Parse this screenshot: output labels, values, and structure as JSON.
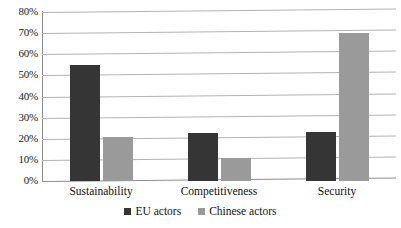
{
  "chart_data": {
    "type": "bar",
    "title": "",
    "subtitle": "",
    "xlabel": "",
    "ylabel": "",
    "categories": [
      "Sustainability",
      "Competitiveness",
      "Security"
    ],
    "series": [
      {
        "name": "EU actors",
        "color": "#353535",
        "values": [
          55,
          22.5,
          23
        ]
      },
      {
        "name": "Chinese actors",
        "color": "#9a9a9a",
        "values": [
          21,
          11,
          70
        ]
      }
    ],
    "ylim": [
      0,
      80
    ],
    "ytick_values": [
      0,
      10,
      20,
      30,
      40,
      50,
      60,
      70,
      80
    ],
    "ytick_labels": [
      "0%",
      "10%",
      "20%",
      "30%",
      "40%",
      "50%",
      "60%",
      "70%",
      "80%"
    ],
    "grid": true,
    "grid_axis": "y",
    "legend": true,
    "legend_position": "bottom",
    "annotations": []
  },
  "legend": {
    "items": [
      {
        "label": "EU actors"
      },
      {
        "label": "Chinese actors"
      }
    ]
  }
}
